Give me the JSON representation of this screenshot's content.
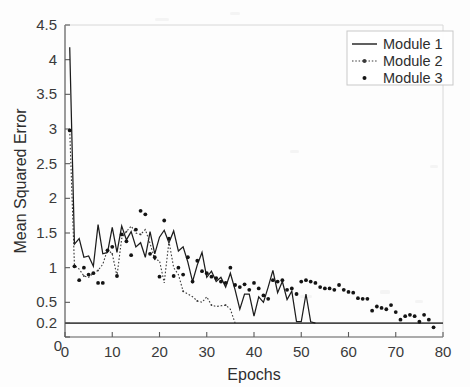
{
  "figure": {
    "title": "",
    "background_color": "#fdfdfd",
    "width": 470,
    "height": 387
  },
  "axis": {
    "x_title": "Epochs",
    "y_title": "Mean Squared Error",
    "x_ticks": [
      "0",
      "10",
      "20",
      "30",
      "40",
      "50",
      "60",
      "70",
      "80"
    ],
    "y_ticks": [
      "0",
      "0.2",
      "0.5",
      "1",
      "1.5",
      "2",
      "2.5",
      "3",
      "3.5",
      "4",
      "4.5"
    ]
  },
  "legend": {
    "position": "top-right",
    "items": [
      {
        "label": "Module 1",
        "marker": "solid-line",
        "color": "#1c1c1c"
      },
      {
        "label": "Module 2",
        "marker": "dotted-line-with-marker",
        "color": "#3a3a3a"
      },
      {
        "label": "Module 3",
        "marker": "dot-only",
        "color": "#141414"
      }
    ]
  },
  "chart_data": {
    "type": "line",
    "title": "",
    "xlabel": "Epochs",
    "ylabel": "Mean Squared Error",
    "xlim": [
      0,
      80
    ],
    "ylim": [
      0,
      4.5
    ],
    "xticks": [
      0,
      10,
      20,
      30,
      40,
      50,
      60,
      70,
      80
    ],
    "yticks": [
      0,
      0.2,
      0.5,
      1,
      1.5,
      2,
      2.5,
      3,
      3.5,
      4,
      4.5
    ],
    "grid": false,
    "legend_position": "upper right",
    "annotations": [
      {
        "type": "hline",
        "y": 0.2,
        "label": "0.2 reference line",
        "color": "#4a4a4a"
      }
    ],
    "series": [
      {
        "name": "Module 1",
        "style": "solid-line",
        "color": "#1c1c1c",
        "x": [
          1,
          2,
          3,
          4,
          5,
          6,
          7,
          8,
          9,
          10,
          11,
          12,
          13,
          14,
          15,
          16,
          17,
          18,
          19,
          20,
          21,
          22,
          23,
          24,
          25,
          26,
          27,
          28,
          29,
          30,
          31,
          32,
          33,
          34,
          35,
          36,
          37,
          38,
          39,
          40,
          41,
          42,
          43,
          44,
          45,
          46,
          47,
          48,
          49,
          50,
          51,
          52,
          53
        ],
        "y": [
          4.18,
          1.34,
          1.42,
          1.15,
          1.17,
          1.02,
          1.62,
          1.2,
          1.22,
          1.58,
          1.22,
          1.6,
          1.4,
          1.52,
          1.3,
          1.36,
          1.15,
          1.52,
          1.2,
          1.44,
          1.54,
          1.36,
          1.53,
          1.24,
          1.3,
          1.08,
          0.8,
          1.04,
          1.22,
          0.86,
          0.95,
          0.8,
          0.86,
          0.72,
          0.92,
          0.68,
          0.4,
          0.62,
          0.62,
          0.3,
          0.58,
          0.5,
          0.72,
          0.96,
          0.64,
          0.8,
          0.54,
          0.66,
          0.22,
          0.22,
          0.62,
          0.22,
          0.2
        ]
      },
      {
        "name": "Module 2",
        "style": "dotted-line",
        "color": "#3a3a3a",
        "x": [
          1,
          2,
          3,
          4,
          5,
          6,
          7,
          8,
          9,
          10,
          11,
          12,
          13,
          14,
          15,
          16,
          17,
          18,
          19,
          20,
          21,
          22,
          23,
          24,
          25,
          26,
          27,
          28,
          29,
          30,
          31,
          32,
          33,
          34,
          35,
          36
        ],
        "y": [
          2.98,
          1.03,
          0.98,
          0.88,
          0.86,
          0.92,
          0.96,
          1.05,
          1.26,
          1.2,
          0.88,
          1.42,
          1.52,
          1.6,
          1.5,
          1.48,
          1.55,
          1.35,
          1.12,
          1.1,
          0.78,
          1.38,
          1.0,
          0.9,
          0.66,
          0.62,
          0.58,
          0.52,
          0.5,
          0.58,
          0.46,
          0.44,
          0.45,
          0.46,
          0.4,
          0.2
        ]
      },
      {
        "name": "Module 3",
        "style": "dot-marker",
        "color": "#141414",
        "x": [
          1,
          2,
          3,
          4,
          5,
          6,
          7,
          8,
          9,
          10,
          11,
          12,
          13,
          14,
          15,
          16,
          17,
          18,
          19,
          20,
          21,
          22,
          23,
          24,
          25,
          26,
          27,
          28,
          29,
          30,
          31,
          32,
          33,
          34,
          35,
          36,
          37,
          38,
          39,
          40,
          41,
          42,
          43,
          44,
          45,
          46,
          47,
          48,
          49,
          50,
          51,
          52,
          53,
          54,
          55,
          56,
          57,
          58,
          59,
          60,
          61,
          62,
          63,
          64,
          65,
          66,
          67,
          68,
          69,
          70,
          71,
          72,
          73,
          74,
          75,
          76,
          77,
          78
        ],
        "y": [
          2.98,
          1.02,
          0.82,
          1.0,
          0.9,
          0.92,
          0.78,
          0.78,
          1.25,
          1.3,
          0.88,
          1.48,
          1.38,
          1.18,
          1.55,
          1.82,
          1.77,
          1.2,
          1.15,
          0.87,
          1.68,
          1.42,
          0.88,
          1.0,
          0.9,
          1.15,
          0.8,
          1.1,
          0.95,
          0.92,
          0.87,
          0.85,
          0.8,
          0.78,
          1.0,
          0.75,
          0.72,
          0.76,
          0.68,
          0.78,
          0.7,
          0.6,
          0.55,
          0.82,
          0.8,
          0.82,
          0.68,
          0.7,
          0.62,
          0.8,
          0.82,
          0.8,
          0.78,
          0.72,
          0.7,
          0.7,
          0.68,
          0.75,
          0.68,
          0.65,
          0.64,
          0.56,
          0.55,
          0.55,
          0.38,
          0.44,
          0.42,
          0.4,
          0.46,
          0.36,
          0.25,
          0.3,
          0.32,
          0.3,
          0.22,
          0.32,
          0.25,
          0.14
        ]
      }
    ]
  }
}
